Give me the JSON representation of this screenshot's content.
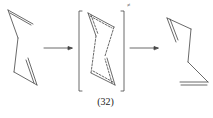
{
  "diagram": {
    "type": "reaction-scheme",
    "reactant": "1,5-hexadiene (chair-like conformer)",
    "transition_state_marker": "≠",
    "product": "rearranged 1,5-diene",
    "label": "(32)",
    "arrows": 2
  }
}
